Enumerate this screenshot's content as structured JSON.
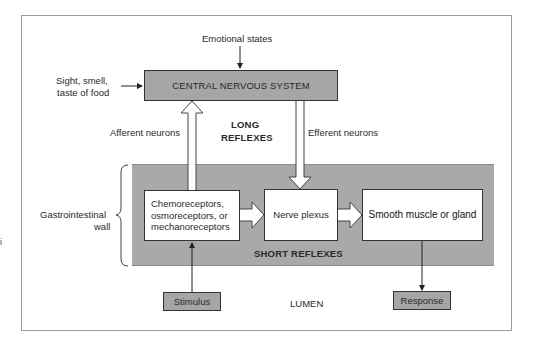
{
  "diagram": {
    "inputs": {
      "emotional_states": "Emotional states",
      "sight_smell_taste_line1": "Sight, smell,",
      "sight_smell_taste_line2": "taste of food"
    },
    "cns_box": "CENTRAL NERVOUS SYSTEM",
    "long_reflexes": {
      "line1": "LONG",
      "line2": "REFLEXES"
    },
    "afferent_label": "Afferent neurons",
    "efferent_label": "Efferent neurons",
    "gi_wall": {
      "line1": "Gastrointestinal",
      "line2": "wall"
    },
    "receptors_box": {
      "line1": "Chemoreceptors,",
      "line2": "osmoreceptors, or",
      "line3": "mechanoreceptors"
    },
    "nerve_plexus_box": "Nerve plexus",
    "effector_box": "Smooth muscle or gland",
    "short_reflexes": "SHORT REFLEXES",
    "stimulus_box": "Stimulus",
    "lumen_label": "LUMEN",
    "response_box": "Response",
    "margin_mark": "i",
    "colors": {
      "box_grey": "#a6a6a6",
      "band_grey": "#a9a9a9",
      "line": "#333333",
      "frame": "#9a9a9a"
    }
  }
}
